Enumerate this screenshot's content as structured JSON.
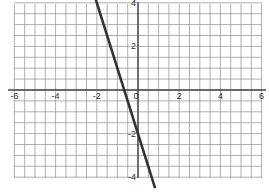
{
  "chart_data": {
    "type": "line",
    "title": "",
    "xlabel": "",
    "ylabel": "",
    "xlim": [
      -6,
      6
    ],
    "ylim": [
      -4.5,
      4.3
    ],
    "grid": true,
    "grid_step": 0.5,
    "x_ticks": [
      "-6",
      "-4",
      "-2",
      "0",
      "2",
      "4",
      "6"
    ],
    "y_ticks": [
      "4",
      "2",
      "-2",
      "-4"
    ],
    "series": [
      {
        "name": "y = -3x - 2",
        "color": "#333333",
        "x": [
          -2.1,
          0.83
        ],
        "y": [
          4.3,
          -4.5
        ]
      }
    ]
  },
  "colors": {
    "grid": "#9a9a9a",
    "axis": "#444444",
    "line": "#333333"
  }
}
